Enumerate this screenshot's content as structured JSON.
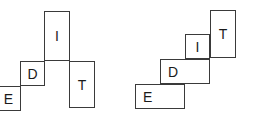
{
  "canvas": {
    "width": 254,
    "height": 116,
    "background": "#ffffff",
    "stroke_color": "#3a3a3a",
    "label_color": "#1a1a1a"
  },
  "figures": [
    {
      "name": "left-figure",
      "description": "partial polyomino net stair arrangement with tall I and T cells",
      "cells": [
        {
          "label": "E",
          "x": -4,
          "y": 86,
          "w": 25,
          "h": 25,
          "align": "center"
        },
        {
          "label": "D",
          "x": 20,
          "y": 61,
          "w": 25,
          "h": 25,
          "align": "center"
        },
        {
          "label": "I",
          "x": 44,
          "y": 11,
          "w": 26,
          "h": 50,
          "align": "center"
        },
        {
          "label": "T",
          "x": 69,
          "y": 61,
          "w": 26,
          "h": 47,
          "align": "center"
        }
      ]
    },
    {
      "name": "right-figure",
      "description": "staircase polyomino arrangement ascending left to right",
      "cells": [
        {
          "label": "E",
          "x": 135,
          "y": 84,
          "w": 50,
          "h": 25,
          "align": "left"
        },
        {
          "label": "D",
          "x": 160,
          "y": 59,
          "w": 50,
          "h": 25,
          "align": "left"
        },
        {
          "label": "I",
          "x": 185,
          "y": 34,
          "w": 25,
          "h": 25,
          "align": "center"
        },
        {
          "label": "T",
          "x": 210,
          "y": 10,
          "w": 26,
          "h": 48,
          "align": "center"
        }
      ]
    }
  ]
}
